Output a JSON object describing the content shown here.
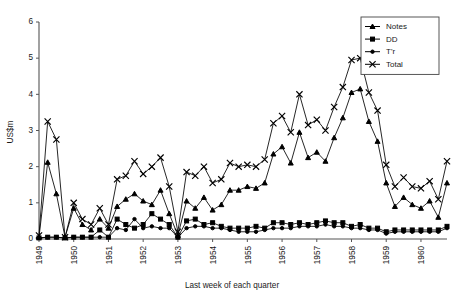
{
  "chart_data": {
    "type": "line",
    "title": "",
    "xlabel": "Last week of each quarter",
    "ylabel": "US$m",
    "ylim": [
      0,
      6
    ],
    "yticks": [
      0,
      1,
      2,
      3,
      4,
      5,
      6
    ],
    "ytick_labels": [
      "0",
      "1",
      "2",
      "3",
      "4",
      "5",
      "6"
    ],
    "xtick_labels": [
      "1949",
      "1950",
      "1951",
      "1952",
      "1953",
      "1954",
      "1955",
      "1956",
      "1957",
      "1958",
      "1959",
      "1960"
    ],
    "xlabel_rotation": -90,
    "grid": false,
    "legend_position": "top-right",
    "x_description": "Quarterly observations (last week of each quarter), 1949 Q1 through 1960 Q4",
    "x": [
      1949.0,
      1949.25,
      1949.5,
      1949.75,
      1950.0,
      1950.25,
      1950.5,
      1950.75,
      1951.0,
      1951.25,
      1951.5,
      1951.75,
      1952.0,
      1952.25,
      1952.5,
      1952.75,
      1953.0,
      1953.25,
      1953.5,
      1953.75,
      1954.0,
      1954.25,
      1954.5,
      1954.75,
      1955.0,
      1955.25,
      1955.5,
      1955.75,
      1956.0,
      1956.25,
      1956.5,
      1956.75,
      1957.0,
      1957.25,
      1957.5,
      1957.75,
      1958.0,
      1958.25,
      1958.5,
      1958.75,
      1959.0,
      1959.25,
      1959.5,
      1959.75,
      1960.0,
      1960.25,
      1960.5,
      1960.75
    ],
    "series": [
      {
        "name": "Notes",
        "marker": "triangle",
        "values": [
          0.05,
          2.12,
          1.25,
          0.05,
          0.85,
          0.4,
          0.25,
          0.55,
          0.3,
          0.9,
          1.1,
          1.25,
          1.05,
          0.95,
          1.35,
          0.7,
          0.1,
          1.05,
          0.85,
          1.15,
          0.8,
          0.95,
          1.35,
          1.35,
          1.45,
          1.4,
          1.55,
          2.35,
          2.55,
          2.1,
          2.95,
          2.25,
          2.4,
          2.15,
          2.8,
          3.35,
          4.05,
          4.15,
          3.25,
          2.7,
          1.55,
          0.9,
          1.15,
          0.95,
          0.85,
          1.05,
          0.6,
          1.55
        ]
      },
      {
        "name": "DD",
        "marker": "square",
        "values": [
          0.03,
          0.05,
          0.05,
          0.03,
          0.05,
          0.05,
          0.05,
          0.25,
          0.05,
          0.55,
          0.4,
          0.3,
          0.4,
          0.7,
          0.55,
          0.4,
          0.05,
          0.5,
          0.55,
          0.4,
          0.45,
          0.35,
          0.3,
          0.3,
          0.3,
          0.35,
          0.3,
          0.45,
          0.45,
          0.4,
          0.45,
          0.4,
          0.45,
          0.5,
          0.45,
          0.45,
          0.35,
          0.4,
          0.3,
          0.3,
          0.2,
          0.25,
          0.25,
          0.25,
          0.25,
          0.25,
          0.25,
          0.35
        ]
      },
      {
        "name": "T'r",
        "marker": "dot",
        "values": [
          0.03,
          0.05,
          0.05,
          0.03,
          0.05,
          0.05,
          0.05,
          0.05,
          0.05,
          0.3,
          0.25,
          0.55,
          0.3,
          0.35,
          0.3,
          0.3,
          0.05,
          0.3,
          0.35,
          0.35,
          0.3,
          0.3,
          0.25,
          0.2,
          0.2,
          0.2,
          0.25,
          0.3,
          0.3,
          0.3,
          0.35,
          0.35,
          0.35,
          0.4,
          0.35,
          0.35,
          0.3,
          0.3,
          0.25,
          0.25,
          0.15,
          0.2,
          0.2,
          0.2,
          0.2,
          0.2,
          0.2,
          0.3
        ]
      },
      {
        "name": "Total",
        "marker": "x",
        "values": [
          0.1,
          3.25,
          2.75,
          0.05,
          1.0,
          0.55,
          0.4,
          0.85,
          0.4,
          1.65,
          1.75,
          2.15,
          1.8,
          2.0,
          2.25,
          1.45,
          0.2,
          1.85,
          1.75,
          2.0,
          1.55,
          1.65,
          2.1,
          2.0,
          2.05,
          2.0,
          2.2,
          3.2,
          3.4,
          2.95,
          4.0,
          3.15,
          3.3,
          3.0,
          3.65,
          4.2,
          4.95,
          5.0,
          4.05,
          3.55,
          2.05,
          1.45,
          1.7,
          1.45,
          1.4,
          1.6,
          1.1,
          2.15
        ]
      }
    ]
  },
  "legend": {
    "entries": [
      {
        "label": "Notes"
      },
      {
        "label": "DD"
      },
      {
        "label": "T'r"
      },
      {
        "label": "Total"
      }
    ]
  }
}
